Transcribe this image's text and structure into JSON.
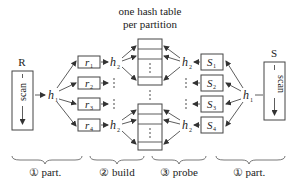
{
  "title": {
    "line1": "one hash table",
    "line2": "per partition"
  },
  "left_relation": {
    "label": "R",
    "scan_label": "scan",
    "hash_fn": "h",
    "hash_sub": "1"
  },
  "right_relation": {
    "label": "S",
    "scan_label": "scan",
    "hash_fn": "h",
    "hash_sub": "1"
  },
  "left_partitions": [
    {
      "name": "r",
      "sub": "1"
    },
    {
      "name": "r",
      "sub": "2"
    },
    {
      "name": "r",
      "sub": "3"
    },
    {
      "name": "r",
      "sub": "4"
    }
  ],
  "right_partitions": [
    {
      "name": "S",
      "sub": "1"
    },
    {
      "name": "S",
      "sub": "2"
    },
    {
      "name": "S",
      "sub": "3"
    },
    {
      "name": "S",
      "sub": "4"
    }
  ],
  "second_hash": {
    "fn": "h",
    "sub": "2"
  },
  "phases": [
    {
      "label": "① part."
    },
    {
      "label": "② build"
    },
    {
      "label": "③ probe"
    },
    {
      "label": "① part."
    }
  ],
  "colors": {
    "stroke": "#444444",
    "text": "#222222",
    "background": "#ffffff"
  }
}
